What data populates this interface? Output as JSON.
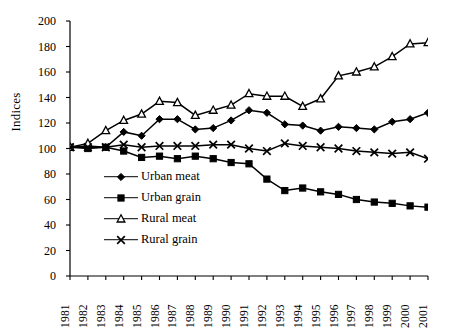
{
  "chart_data": {
    "type": "line",
    "title": "",
    "xlabel": "",
    "ylabel": "Indices",
    "ylim": [
      0,
      200
    ],
    "ytick_step": 20,
    "yticks": [
      0,
      20,
      40,
      60,
      80,
      100,
      120,
      140,
      160,
      180,
      200
    ],
    "grid": false,
    "legend_position": "inside-left-middle",
    "categories": [
      "1981",
      "1982",
      "1983",
      "1984",
      "1985",
      "1986",
      "1987",
      "1988",
      "1989",
      "1990",
      "1991",
      "1992",
      "1993",
      "1994",
      "1995",
      "1996",
      "1997",
      "1998",
      "1999",
      "2000",
      "2001"
    ],
    "series": [
      {
        "name": "Urban meat",
        "marker": "filled-diamond",
        "color": "#000000",
        "values": [
          101,
          102,
          101,
          113,
          110,
          123,
          123,
          115,
          116,
          122,
          130,
          128,
          119,
          118,
          114,
          117,
          116,
          115,
          121,
          123,
          128
        ]
      },
      {
        "name": "Urban grain",
        "marker": "filled-square",
        "color": "#000000",
        "values": [
          101,
          100,
          101,
          98,
          93,
          94,
          92,
          94,
          92,
          89,
          88,
          76,
          67,
          69,
          66,
          64,
          60,
          58,
          57,
          55,
          54
        ]
      },
      {
        "name": "Rural meat",
        "marker": "hollow-triangle",
        "color": "#000000",
        "values": [
          101,
          104,
          114,
          122,
          127,
          137,
          136,
          126,
          130,
          134,
          143,
          141,
          141,
          133,
          139,
          157,
          160,
          164,
          172,
          182,
          183
        ]
      },
      {
        "name": "Rural grain",
        "marker": "x-cross",
        "color": "#000000",
        "values": [
          101,
          101,
          101,
          103,
          101,
          102,
          102,
          102,
          103,
          103,
          100,
          98,
          104,
          102,
          101,
          100,
          98,
          97,
          96,
          97,
          92
        ]
      }
    ]
  },
  "axis": {
    "y_title": "Indices"
  }
}
